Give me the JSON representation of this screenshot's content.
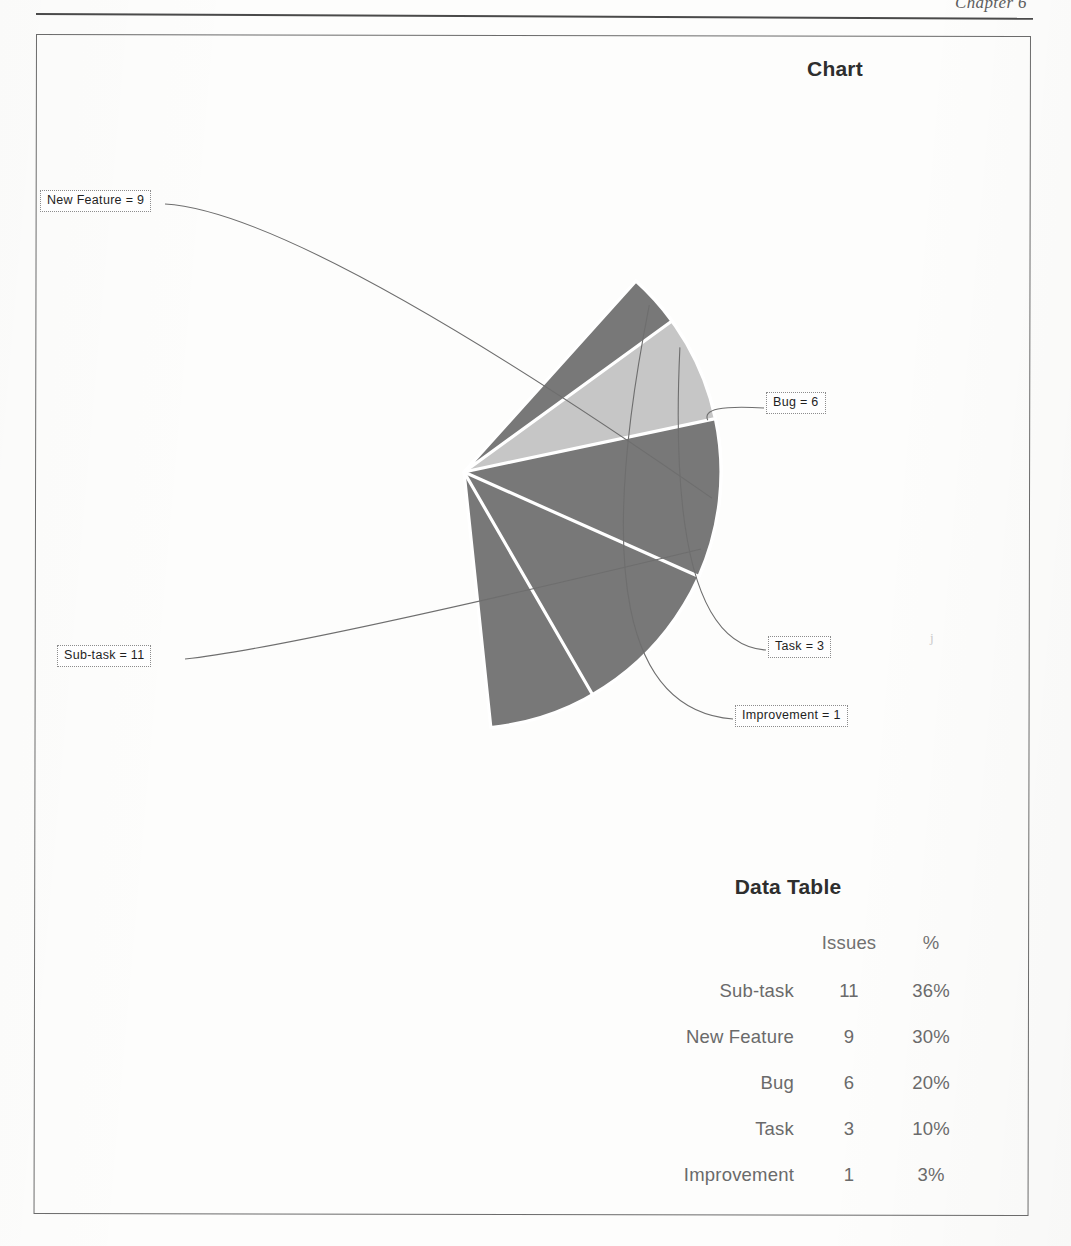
{
  "page": {
    "running_header": "Chapter 6"
  },
  "chart_panel": {
    "title": "Chart"
  },
  "callouts": [
    {
      "name": "new-feature",
      "text": "New Feature = 9"
    },
    {
      "name": "bug",
      "text": "Bug = 6"
    },
    {
      "name": "task",
      "text": "Task = 3"
    },
    {
      "name": "improvement",
      "text": "Improvement = 1"
    },
    {
      "name": "sub-task",
      "text": "Sub-task = 11"
    }
  ],
  "data_table": {
    "title": "Data Table",
    "headers": [
      "",
      "Issues",
      "%"
    ],
    "rows": [
      {
        "name": "Sub-task",
        "issues": "11",
        "pct": "36%"
      },
      {
        "name": "New Feature",
        "issues": "9",
        "pct": "30%"
      },
      {
        "name": "Bug",
        "issues": "6",
        "pct": "20%"
      },
      {
        "name": "Task",
        "issues": "3",
        "pct": "10%"
      },
      {
        "name": "Improvement",
        "issues": "1",
        "pct": "3%"
      }
    ]
  },
  "chart_data": {
    "type": "pie",
    "title": "Chart",
    "categories": [
      "Sub-task",
      "New Feature",
      "Bug",
      "Task",
      "Improvement"
    ],
    "values": [
      11,
      9,
      6,
      3,
      1
    ],
    "percents": [
      36,
      30,
      20,
      10,
      3
    ],
    "total_issues": 30,
    "value_label_format": "{name} = {value}",
    "legend": "none",
    "labels_position": "outside-callout-with-leader-lines",
    "slice_colors": [
      "#787878",
      "#787878",
      "#787878",
      "#c6c6c6",
      "#787878"
    ],
    "slice_border_color": "#ffffff",
    "center_px": [
      464,
      472
    ],
    "radius_px": 257,
    "start_angle_deg": -48,
    "direction": "clockwise",
    "grid": false
  },
  "colors": {
    "slice_dark": "#787878",
    "slice_light": "#c6c6c6",
    "separator": "#ffffff",
    "frame_border": "#6b6b6b",
    "title_text": "#2e2e2e",
    "table_text": "#6a6a6a",
    "leader_line": "#6e6e6e"
  }
}
